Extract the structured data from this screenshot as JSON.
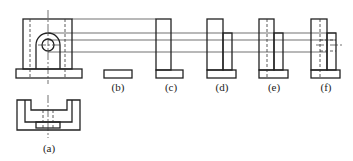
{
  "diagram": {
    "type": "orthographic-projection-exercise",
    "views": [
      {
        "id": "a",
        "label": "(a)",
        "description": "front view and top view of bracket with arched boss and hole"
      },
      {
        "id": "b",
        "label": "(b)",
        "description": "candidate side view - base only"
      },
      {
        "id": "c",
        "label": "(c)",
        "description": "candidate side view - upright on base"
      },
      {
        "id": "d",
        "label": "(d)",
        "description": "candidate side view - upright with step"
      },
      {
        "id": "e",
        "label": "(e)",
        "description": "candidate side view - upright with step and hidden line"
      },
      {
        "id": "f",
        "label": "(f)",
        "description": "candidate side view - upright with step, hidden hole lines and center line"
      }
    ],
    "colors": {
      "line": "#222222",
      "background": "#ffffff"
    }
  }
}
